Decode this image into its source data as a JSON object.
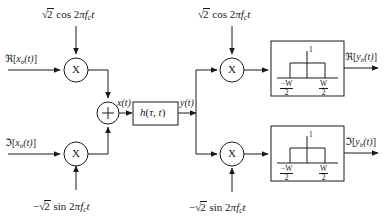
{
  "figure": {
    "line_color": "#1a1a1a",
    "background_color": "#ffffff"
  },
  "transmitter": {
    "carrier_top": {
      "radical": "√",
      "radicand": "2",
      "trig": "cos 2",
      "pi": "π",
      "freq": "f",
      "freq_sub": "c",
      "time": "t",
      "full_text": "√2 cos 2πf_c t"
    },
    "carrier_bottom": {
      "sign": "−",
      "radical": "√",
      "radicand": "2",
      "trig": "sin 2",
      "pi": "π",
      "freq": "f",
      "freq_sub": "c",
      "time": "t",
      "full_text": "−√2 sin 2πf_c t"
    },
    "input_real": {
      "operator": "ℜ",
      "bracket_open": "[",
      "symbol": "x",
      "symbol_sub": "b",
      "arg": "(t)",
      "bracket_close": "]",
      "full_text": "ℜ[x_b(t)]"
    },
    "input_imag": {
      "operator": "ℑ",
      "bracket_open": "[",
      "symbol": "x",
      "symbol_sub": "b",
      "arg": "(t)",
      "bracket_close": "]",
      "full_text": "ℑ[x_b(t)]"
    },
    "multiplier_top_label": "X",
    "multiplier_bottom_label": "X",
    "summer_label": "+",
    "sum_output": {
      "symbol": "x",
      "arg": "(t)",
      "full_text": "x(t)"
    }
  },
  "channel": {
    "block_label": {
      "symbol": "h",
      "open": "(",
      "tau": "τ",
      "comma": ", ",
      "time": "t",
      "close": ")",
      "full_text": "h(τ, t)"
    },
    "output": {
      "symbol": "y",
      "arg": "(t)",
      "full_text": "y(t)"
    }
  },
  "receiver": {
    "carrier_top": {
      "radical": "√",
      "radicand": "2",
      "trig": "cos 2",
      "pi": "π",
      "freq": "f",
      "freq_sub": "c",
      "time": "t",
      "full_text": "√2 cos 2πf_c t"
    },
    "carrier_bottom": {
      "sign": "−",
      "radical": "√",
      "radicand": "2",
      "trig": "sin 2",
      "pi": "π",
      "freq": "f",
      "freq_sub": "c",
      "time": "t",
      "full_text": "−√2 sin 2πf_c t"
    },
    "multiplier_top_label": "X",
    "multiplier_bottom_label": "X",
    "output_real": {
      "operator": "ℜ",
      "bracket_open": "[",
      "symbol": "y",
      "symbol_sub": "b",
      "arg": "(t)",
      "bracket_close": "]",
      "full_text": "ℜ[y_b(t)]"
    },
    "output_imag": {
      "operator": "ℑ",
      "bracket_open": "[",
      "symbol": "y",
      "symbol_sub": "b",
      "arg": "(t)",
      "bracket_close": "]",
      "full_text": "ℑ[y_b(t)]"
    },
    "lowpass_top": {
      "amplitude_label": "1",
      "left_edge_num": "−W",
      "left_edge_den": "2",
      "right_edge_num": "W",
      "right_edge_den": "2",
      "left_edge_text": "−W/2",
      "right_edge_text": "W/2"
    },
    "lowpass_bottom": {
      "amplitude_label": "1",
      "left_edge_num": "−W",
      "left_edge_den": "2",
      "right_edge_num": "W",
      "right_edge_den": "2",
      "left_edge_text": "−W/2",
      "right_edge_text": "W/2"
    }
  }
}
